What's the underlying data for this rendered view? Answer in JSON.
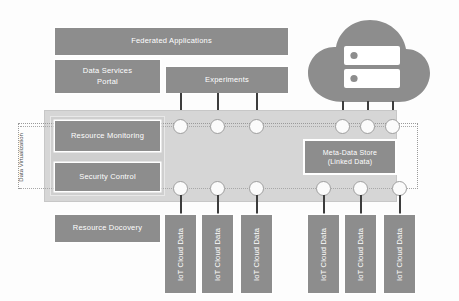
{
  "diagram": {
    "colors": {
      "box_fill": "#8d8d8d",
      "band_fill": "#d6d6d6",
      "band_inner_fill": "#cfcfcf",
      "node_fill": "#fbfbfb",
      "node_border": "#9e9e9e",
      "stem": "#3d3d3d",
      "cloud": "#8d8d8d",
      "dotted_border": "#9a9a9a",
      "label_text": "#4a4a4a",
      "box_text": "#ffffff",
      "background": "#fdfdfd"
    }
  },
  "top_layer": {
    "federated_applications": "Federated Applications",
    "data_services_portal_line1": "Data Services",
    "data_services_portal_line2": "Portal",
    "experiments": "Experiments"
  },
  "middle_layer": {
    "resource_monitoring": "Resource Monitoring",
    "security_control": "Security Control",
    "meta_data_store_line1": "Meta-Data Store",
    "meta_data_store_line2": "(Linked Data)",
    "virtualization_label_line1": "Data",
    "virtualization_label_line2": "Virtualization"
  },
  "bottom_layer": {
    "resource_discovery": "Resource Docovery",
    "iot_sources": [
      "IoT Cloud Data",
      "IoT Cloud Data",
      "IoT Cloud Data",
      "IoT Cloud Data",
      "IoT Cloud Data",
      "IoT Cloud Data"
    ]
  },
  "cloud": {
    "icon": "cloud-server-icon",
    "server_units": 2
  },
  "connectors": {
    "top_row_count": 6,
    "bottom_row_count": 6,
    "bus_style": "dotted"
  }
}
